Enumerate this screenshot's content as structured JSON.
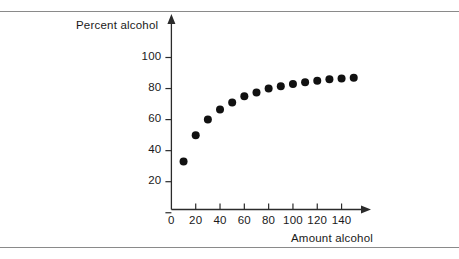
{
  "figure": {
    "background_color": "#ffffff",
    "rule_color": "#8a8a8a",
    "marker_color": "#111111"
  },
  "chart_data": {
    "type": "scatter",
    "title": "",
    "xlabel": "Amount alcohol",
    "ylabel": "Percent alcohol",
    "xlim": [
      0,
      160
    ],
    "ylim": [
      0,
      112
    ],
    "xticks": [
      0,
      20,
      40,
      60,
      80,
      100,
      120,
      140
    ],
    "xtick_labels": [
      "0",
      "20",
      "40",
      "60",
      "80",
      "100",
      "120",
      "140"
    ],
    "yticks": [
      20,
      40,
      60,
      80,
      100
    ],
    "ytick_labels": [
      "20",
      "40",
      "60",
      "80",
      "100"
    ],
    "grid": false,
    "legend": null,
    "x": [
      10,
      20,
      30,
      40,
      50,
      60,
      70,
      80,
      90,
      100,
      110,
      120,
      130,
      140,
      150
    ],
    "y": [
      33,
      50,
      60,
      66.5,
      71,
      75,
      77.5,
      80,
      81.5,
      83,
      84,
      85,
      86,
      86.5,
      87
    ],
    "points": [
      {
        "x": 10,
        "y": 33
      },
      {
        "x": 20,
        "y": 50
      },
      {
        "x": 30,
        "y": 60
      },
      {
        "x": 40,
        "y": 66.5
      },
      {
        "x": 50,
        "y": 71
      },
      {
        "x": 60,
        "y": 75
      },
      {
        "x": 70,
        "y": 77.5
      },
      {
        "x": 80,
        "y": 80
      },
      {
        "x": 90,
        "y": 81.5
      },
      {
        "x": 100,
        "y": 83
      },
      {
        "x": 110,
        "y": 84
      },
      {
        "x": 120,
        "y": 85
      },
      {
        "x": 130,
        "y": 86
      },
      {
        "x": 140,
        "y": 86.5
      },
      {
        "x": 150,
        "y": 87
      }
    ],
    "marker": {
      "shape": "circle",
      "size_px": 5.2,
      "color": "#111111"
    },
    "axis_arrows": {
      "x": true,
      "y": true
    }
  }
}
